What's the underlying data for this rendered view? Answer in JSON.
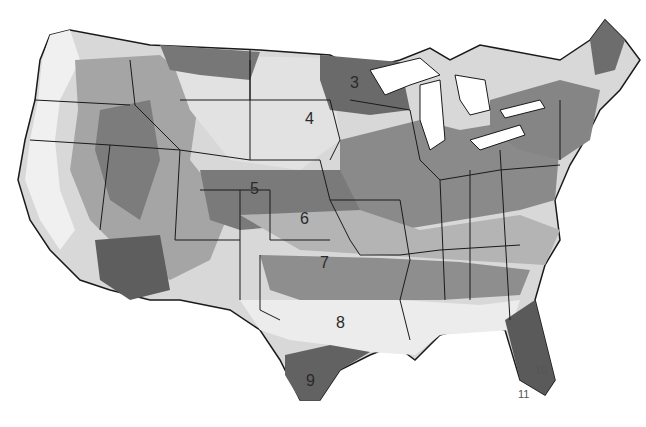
{
  "map": {
    "type": "grayscale zone map of the contiguous United States",
    "colors": {
      "background": "#ffffff",
      "outline": "#1a1a1a",
      "zone_light": "#e6e6e6",
      "zone_mid_light": "#c4c4c4",
      "zone_mid": "#9a9a9a",
      "zone_dark": "#6e6e6e",
      "zone_darkest": "#4a4a4a"
    },
    "zone_labels": [
      {
        "id": "3",
        "text": "3",
        "x": 353,
        "y": 82
      },
      {
        "id": "4",
        "text": "4",
        "x": 308,
        "y": 118
      },
      {
        "id": "5",
        "text": "5",
        "x": 252,
        "y": 188
      },
      {
        "id": "6",
        "text": "6",
        "x": 303,
        "y": 218
      },
      {
        "id": "7",
        "text": "7",
        "x": 322,
        "y": 262
      },
      {
        "id": "8",
        "text": "8",
        "x": 338,
        "y": 322
      },
      {
        "id": "9",
        "text": "9",
        "x": 309,
        "y": 380
      },
      {
        "id": "10",
        "text": "10",
        "x": 537,
        "y": 370
      },
      {
        "id": "11",
        "text": "11",
        "x": 518,
        "y": 393
      }
    ]
  }
}
